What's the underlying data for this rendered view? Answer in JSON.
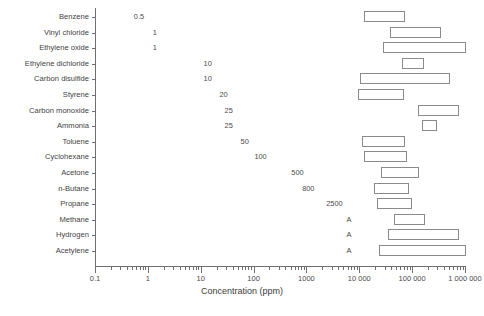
{
  "chart_data": {
    "type": "bar",
    "subtype": "horizontal-range-bars",
    "title": "",
    "xlabel": "Concentration (ppm)",
    "ylabel": "",
    "xscale": "log",
    "xlim": [
      0.1,
      1000000
    ],
    "grid": false,
    "legend": null,
    "xtick_labels": [
      "0.1",
      "1",
      "10",
      "100",
      "1000",
      "10 000",
      "100 000",
      "1 000 000"
    ],
    "xtick_values": [
      0.1,
      1,
      10,
      100,
      1000,
      10000,
      100000,
      1000000
    ],
    "categories": [
      "Benzene",
      "Vinyl chloride",
      "Ethylene oxide",
      "Ethylene dichloride",
      "Carbon disulfide",
      "Styrene",
      "Carbon monoxide",
      "Ammonia",
      "Toluene",
      "Cyclohexane",
      "Acetone",
      "n-Butane",
      "Propane",
      "Methane",
      "Hydrogen",
      "Acetylene"
    ],
    "threshold_labels": [
      "0.5",
      "1",
      "1",
      "10",
      "10",
      "20",
      "25",
      "25",
      "50",
      "100",
      "500",
      "800",
      "2500",
      "A",
      "A",
      "A"
    ],
    "threshold_values": [
      0.5,
      1,
      1,
      10,
      10,
      20,
      25,
      25,
      50,
      100,
      500,
      800,
      2500,
      null,
      null,
      null
    ],
    "threshold_note": "A = asphyxiant (no exposure limit value shown)",
    "ranges": [
      {
        "name": "Benzene",
        "low": 12000,
        "high": 71000
      },
      {
        "name": "Vinyl chloride",
        "low": 36000,
        "high": 330000
      },
      {
        "name": "Ethylene oxide",
        "low": 27000,
        "high": 1000000
      },
      {
        "name": "Ethylene dichloride",
        "low": 62000,
        "high": 160000
      },
      {
        "name": "Carbon disulfide",
        "low": 10000,
        "high": 500000
      },
      {
        "name": "Styrene",
        "low": 9000,
        "high": 68000
      },
      {
        "name": "Carbon monoxide",
        "low": 125000,
        "high": 740000
      },
      {
        "name": "Ammonia",
        "low": 150000,
        "high": 280000
      },
      {
        "name": "Toluene",
        "low": 11000,
        "high": 71000
      },
      {
        "name": "Cyclohexane",
        "low": 12000,
        "high": 78000
      },
      {
        "name": "Acetone",
        "low": 25000,
        "high": 130000
      },
      {
        "name": "n-Butane",
        "low": 18000,
        "high": 84000
      },
      {
        "name": "Propane",
        "low": 21000,
        "high": 95000
      },
      {
        "name": "Methane",
        "low": 44000,
        "high": 165000
      },
      {
        "name": "Hydrogen",
        "low": 33000,
        "high": 750000
      },
      {
        "name": "Acetylene",
        "low": 23000,
        "high": 1000000
      }
    ]
  },
  "caption": ""
}
